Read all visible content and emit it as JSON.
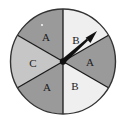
{
  "figure": {
    "name": "spinner-wheel",
    "type": "probability-spinner",
    "background_color": "#ffffff"
  },
  "spinner": {
    "center_x": 63,
    "center_y": 61.5,
    "radius": 52.5,
    "outline_color": "#333333",
    "divider_color": "#1a1a1a",
    "sector_count": 6,
    "sectors": [
      {
        "label": "A",
        "start_angle_deg": 90,
        "end_angle_deg": 150,
        "fill": "#9a9a9a",
        "label_x": 46,
        "label_y": 38
      },
      {
        "label": "C",
        "start_angle_deg": 150,
        "end_angle_deg": 210,
        "fill": "#c6c6c6",
        "label_x": 33,
        "label_y": 64
      },
      {
        "label": "A",
        "start_angle_deg": 210,
        "end_angle_deg": 270,
        "fill": "#9a9a9a",
        "label_x": 47,
        "label_y": 88
      },
      {
        "label": "B",
        "start_angle_deg": 270,
        "end_angle_deg": 330,
        "fill": "#efefef",
        "label_x": 75,
        "label_y": 87
      },
      {
        "label": "A",
        "start_angle_deg": 330,
        "end_angle_deg": 30,
        "fill": "#9a9a9a",
        "label_x": 90,
        "label_y": 63
      },
      {
        "label": "B",
        "start_angle_deg": 30,
        "end_angle_deg": 90,
        "fill": "#efefef",
        "label_x": 76,
        "label_y": 41
      }
    ]
  },
  "pointer": {
    "name": "spinner-arrow",
    "tip_x": 97,
    "tip_y": 31,
    "color": "#111111",
    "pivot_radius": 3.2,
    "angle_deg": 54
  },
  "speck": {
    "x": 42,
    "y": 25,
    "radius": 1.1,
    "color": "#f2f2f2"
  }
}
